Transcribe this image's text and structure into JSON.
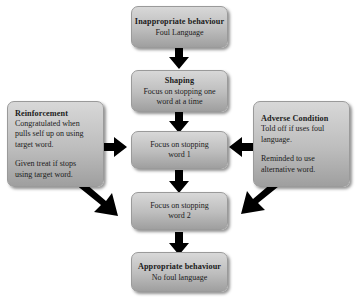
{
  "diagram": {
    "background_color": "#ffffff",
    "node_fill_top": "#d8d8d8",
    "node_fill_bottom": "#9f9f9f",
    "node_border_color": "#9a9a9a",
    "arrow_color": "#000000",
    "nodes": {
      "inappropriate": {
        "title": "Inappropriate behaviour",
        "line1": "Foul Language"
      },
      "shaping": {
        "title": "Shaping",
        "line1": "Focus on stopping one",
        "line2": "word at a time"
      },
      "reinforcement": {
        "title": "Reinforcement",
        "line1": "Congratulated when",
        "line2": "pulls self up on using",
        "line3": "target word.",
        "line4": "Given treat if stops",
        "line5": "using target word."
      },
      "adverse": {
        "title": "Adverse Condition",
        "line1": "Told off if uses foul",
        "line2": "language.",
        "line3": "Reminded to use",
        "line4": "alternative word."
      },
      "word1": {
        "line1": "Focus on stopping",
        "line2": "word 1"
      },
      "word2": {
        "line1": "Focus on stopping",
        "line2": "word 2"
      },
      "appropriate": {
        "title": "Appropriate behaviour",
        "line1": "No foul language"
      }
    },
    "arrows": [
      {
        "name": "inappropriate-to-shaping",
        "direction": "down"
      },
      {
        "name": "shaping-to-word1",
        "direction": "down"
      },
      {
        "name": "reinforcement-to-word1",
        "direction": "right"
      },
      {
        "name": "adverse-to-word1",
        "direction": "left"
      },
      {
        "name": "word1-to-word2",
        "direction": "down"
      },
      {
        "name": "reinforcement-to-word2",
        "direction": "down-right"
      },
      {
        "name": "adverse-to-word2",
        "direction": "down-left"
      },
      {
        "name": "word2-to-appropriate",
        "direction": "down"
      }
    ]
  }
}
